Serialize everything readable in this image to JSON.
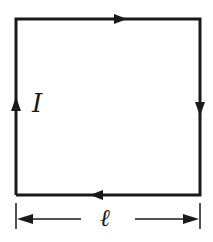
{
  "diagram": {
    "type": "square current loop",
    "current_label": "I",
    "side_label": "ℓ",
    "current_direction": "clockwise",
    "colors": {
      "line": "#1a1a1a",
      "background": "#ffffff"
    }
  }
}
